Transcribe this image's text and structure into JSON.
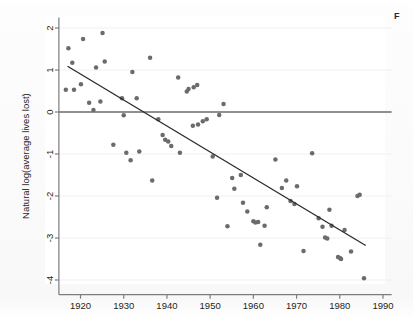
{
  "figure": {
    "caption_fragment": "F",
    "background_color": "#ffffff",
    "point_color": "#6b6b6e",
    "line_color": "#2a2a2a",
    "axis_color": "#7d7d80",
    "gridline_color": "#f0f0f2",
    "zero_line_color": "#6e6e71"
  },
  "chart_data": {
    "type": "scatter",
    "title": "",
    "subtitle": "",
    "xlabel": "",
    "ylabel": "Natural log(average lives lost)",
    "xlim": [
      1915,
      1992
    ],
    "ylim": [
      -4.35,
      2.25
    ],
    "xticks": [
      1920,
      1930,
      1940,
      1950,
      1960,
      1970,
      1980,
      1990
    ],
    "xticklabels": [
      "1920",
      "1930",
      "1940",
      "1950",
      "1960",
      "1970",
      "1980",
      "1990"
    ],
    "yticks": [
      2,
      1,
      0,
      -1,
      -2,
      -3,
      -4
    ],
    "yticklabels": [
      "2",
      "1",
      "0",
      "-1",
      "-2",
      "-3",
      "-4"
    ],
    "grid": true,
    "grid_axis": "y",
    "legend": false,
    "legend_position": "none",
    "annotations": [
      {
        "name": "zero-reference-line",
        "type": "hline",
        "y": 0,
        "x_from": 1915,
        "x_to": 1992
      },
      {
        "name": "fit-line",
        "type": "line",
        "x_from": 1917,
        "y_from": 1.09,
        "x_to": 1986,
        "y_to": -3.18
      }
    ],
    "series": [
      {
        "name": "Natural log(average lives lost)",
        "marker": "circle",
        "color": "#6b6b6e",
        "points": [
          [
            1916.6,
            0.53
          ],
          [
            1917.2,
            1.52
          ],
          [
            1918.1,
            1.17
          ],
          [
            1918.5,
            0.53
          ],
          [
            1920.1,
            0.66
          ],
          [
            1920.6,
            1.74
          ],
          [
            1922.0,
            0.22
          ],
          [
            1923.0,
            0.05
          ],
          [
            1923.6,
            1.06
          ],
          [
            1924.6,
            0.25
          ],
          [
            1925.1,
            1.88
          ],
          [
            1925.6,
            1.2
          ],
          [
            1927.6,
            -0.78
          ],
          [
            1929.6,
            0.33
          ],
          [
            1930.0,
            -0.08
          ],
          [
            1930.6,
            -0.97
          ],
          [
            1931.6,
            -1.15
          ],
          [
            1932.0,
            0.95
          ],
          [
            1933.0,
            0.33
          ],
          [
            1933.6,
            -0.94
          ],
          [
            1936.1,
            1.29
          ],
          [
            1936.6,
            -1.63
          ],
          [
            1938.0,
            -0.17
          ],
          [
            1939.0,
            -0.55
          ],
          [
            1939.6,
            -0.66
          ],
          [
            1940.3,
            -0.7
          ],
          [
            1941.0,
            -0.81
          ],
          [
            1942.6,
            0.82
          ],
          [
            1943.0,
            -0.97
          ],
          [
            1944.6,
            0.49
          ],
          [
            1945.0,
            0.55
          ],
          [
            1946.2,
            0.59
          ],
          [
            1946.0,
            -0.33
          ],
          [
            1947.0,
            0.64
          ],
          [
            1947.2,
            -0.3
          ],
          [
            1948.3,
            -0.22
          ],
          [
            1949.2,
            -0.17
          ],
          [
            1950.6,
            -1.06
          ],
          [
            1951.6,
            -2.04
          ],
          [
            1952.1,
            -0.07
          ],
          [
            1953.1,
            0.19
          ],
          [
            1954.0,
            -2.72
          ],
          [
            1955.1,
            -1.57
          ],
          [
            1955.6,
            -1.83
          ],
          [
            1957.1,
            -1.5
          ],
          [
            1957.6,
            -2.16
          ],
          [
            1958.6,
            -2.37
          ],
          [
            1960.0,
            -2.6
          ],
          [
            1960.5,
            -2.63
          ],
          [
            1961.1,
            -2.62
          ],
          [
            1961.6,
            -3.16
          ],
          [
            1962.6,
            -2.71
          ],
          [
            1963.1,
            -2.27
          ],
          [
            1965.1,
            -1.13
          ],
          [
            1966.6,
            -1.81
          ],
          [
            1967.6,
            -1.63
          ],
          [
            1968.6,
            -2.12
          ],
          [
            1969.5,
            -2.19
          ],
          [
            1970.1,
            -1.77
          ],
          [
            1971.6,
            -3.31
          ],
          [
            1973.6,
            -0.98
          ],
          [
            1975.1,
            -2.53
          ],
          [
            1976.0,
            -2.73
          ],
          [
            1976.6,
            -2.99
          ],
          [
            1977.1,
            -3.01
          ],
          [
            1977.6,
            -2.33
          ],
          [
            1978.1,
            -2.71
          ],
          [
            1979.6,
            -3.45
          ],
          [
            1980.1,
            -3.48
          ],
          [
            1980.3,
            -3.5
          ],
          [
            1981.1,
            -2.81
          ],
          [
            1982.6,
            -3.32
          ],
          [
            1984.1,
            -2.0
          ],
          [
            1984.6,
            -1.97
          ],
          [
            1985.6,
            -3.96
          ]
        ]
      }
    ]
  }
}
